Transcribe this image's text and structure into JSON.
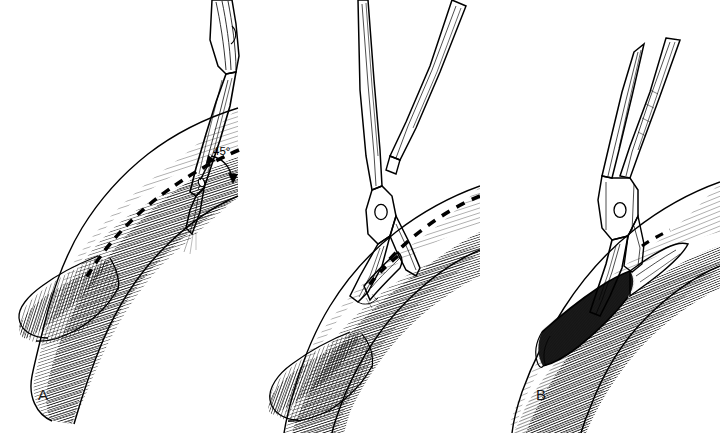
{
  "figure": {
    "background_color": "#ffffff",
    "ink_color": "#000000",
    "style": "pen-and-ink line hatching medical illustration",
    "panel_count": 3
  },
  "panels": [
    {
      "id": "A",
      "label": "A",
      "description": "Scalpel blade entering the anterior wall of the artery at a 45 degree angle along the planned dashed incision line; vessel shown with a branch at the bifurcation.",
      "instruments": [
        "scalpel"
      ],
      "annotations": [
        {
          "name": "angle-annotation",
          "text": "45°",
          "value": 45,
          "unit": "degrees",
          "has_curved_arrow": true
        }
      ],
      "markings": [
        "dashed-incision-line"
      ]
    },
    {
      "id": "B",
      "label": "B",
      "description": "Fine-tipped Potts scissors inserted into the stab arteriotomy extending the incision along the dashed line toward the distal vessel.",
      "instruments": [
        "potts-scissors"
      ],
      "annotations": [],
      "markings": [
        "dashed-incision-line"
      ]
    },
    {
      "id": "C",
      "label": "C",
      "description": "Completed longitudinal arteriotomy with the dark open lumen retracted; scissors blade still within the opening.",
      "instruments": [
        "potts-scissors"
      ],
      "annotations": [],
      "markings": [
        "open-lumen"
      ]
    }
  ],
  "labels": {
    "a": "A",
    "b": "B",
    "c": "C"
  },
  "angle": {
    "text": "45°"
  }
}
